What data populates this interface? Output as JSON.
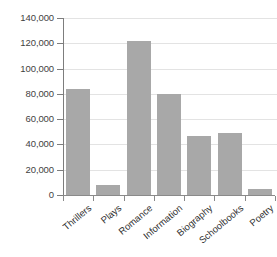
{
  "chart_data": {
    "type": "bar",
    "title": "",
    "subtitle": "",
    "xlabel": "",
    "ylabel": "",
    "categories": [
      "Thrillers",
      "Plays",
      "Romance",
      "Information",
      "Biography",
      "Schoolbooks",
      "Poetry"
    ],
    "values": [
      83500,
      8000,
      122000,
      80000,
      47000,
      49000,
      5000
    ],
    "ylim": [
      0,
      140000
    ],
    "ytick_values": [
      0,
      20000,
      40000,
      60000,
      80000,
      100000,
      120000,
      140000
    ],
    "ytick_labels": [
      "0",
      "20,000",
      "40,000",
      "60,000",
      "80,000",
      "100,000",
      "120,000",
      "140,000"
    ],
    "grid": true,
    "grid_axis": "y",
    "legend": false,
    "legend_position": "none",
    "bar_color": "#a8a8a8",
    "gridline_color": "#e3e3e3",
    "axis_color": "#7d7d7d",
    "background_color": "#ffffff",
    "xtick_label_rotation": -40
  }
}
